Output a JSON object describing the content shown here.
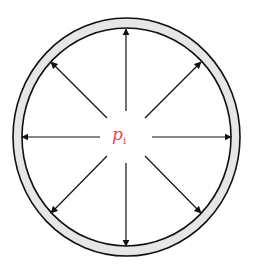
{
  "diagram": {
    "label_main": "p",
    "label_sub": "i",
    "label_color": "#e8454f",
    "arrow_count": 8,
    "shell_fill": "#e6e6e6",
    "stroke_color": "#111111"
  }
}
